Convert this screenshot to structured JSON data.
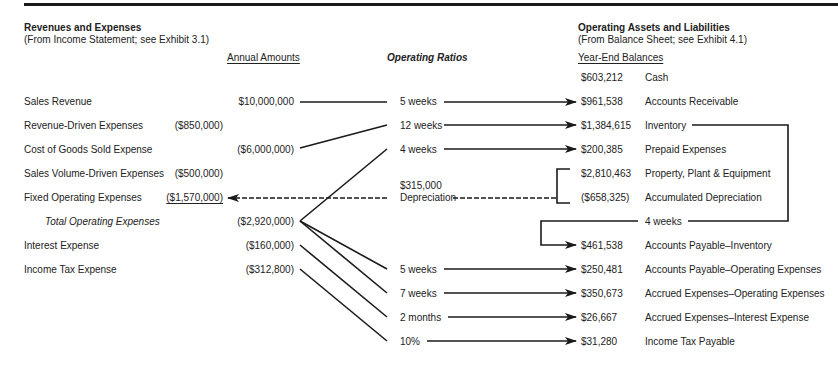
{
  "left": {
    "title": "Revenues and Expenses",
    "subtitle": "(From Income Statement; see Exhibit 3.1)",
    "column_header": "Annual Amounts",
    "rows": [
      {
        "label": "Sales Revenue",
        "sub_amount": "",
        "amount": "$10,000,000"
      },
      {
        "label": "Revenue-Driven Expenses",
        "sub_amount": "($850,000)",
        "amount": ""
      },
      {
        "label": "Cost of Goods Sold Expense",
        "sub_amount": "",
        "amount": "($6,000,000)"
      },
      {
        "label": "Sales Volume-Driven Expenses",
        "sub_amount": "($500,000)",
        "amount": ""
      },
      {
        "label": "Fixed Operating Expenses",
        "sub_amount": "($1,570,000)",
        "amount": ""
      },
      {
        "label": "Total Operating Expenses",
        "sub_amount": "",
        "amount": "($2,920,000)"
      },
      {
        "label": "Interest Expense",
        "sub_amount": "",
        "amount": "($160,000)"
      },
      {
        "label": "Income Tax Expense",
        "sub_amount": "",
        "amount": "($312,800)"
      }
    ]
  },
  "middle": {
    "column_header": "Operating Ratios",
    "ratios": [
      "5 weeks",
      "12 weeks",
      "4 weeks",
      "5 weeks",
      "7 weeks",
      "2 months",
      "10%"
    ],
    "depreciation_amount": "$315,000",
    "depreciation_label": "Depreciation",
    "payables_ratio": "4 weeks"
  },
  "right": {
    "title": "Operating Assets and Liabilities",
    "subtitle": "(From Balance Sheet; see Exhibit 4.1)",
    "column_header": "Year-End Balances",
    "rows": [
      {
        "amount": "$603,212",
        "label": "Cash"
      },
      {
        "amount": "$961,538",
        "label": "Accounts Receivable"
      },
      {
        "amount": "$1,384,615",
        "label": "Inventory"
      },
      {
        "amount": "$200,385",
        "label": "Prepaid Expenses"
      },
      {
        "amount": "$2,810,463",
        "label": "Property, Plant & Equipment"
      },
      {
        "amount": "($658,325)",
        "label": "Accumulated Depreciation"
      },
      {
        "amount": "$461,538",
        "label": "Accounts Payable–Inventory"
      },
      {
        "amount": "$250,481",
        "label": "Accounts Payable–Operating Expenses"
      },
      {
        "amount": "$350,673",
        "label": "Accrued Expenses–Operating Expenses"
      },
      {
        "amount": "$26,667",
        "label": "Accrued Expenses–Interest Expense"
      },
      {
        "amount": "$31,280",
        "label": "Income Tax Payable"
      }
    ]
  }
}
